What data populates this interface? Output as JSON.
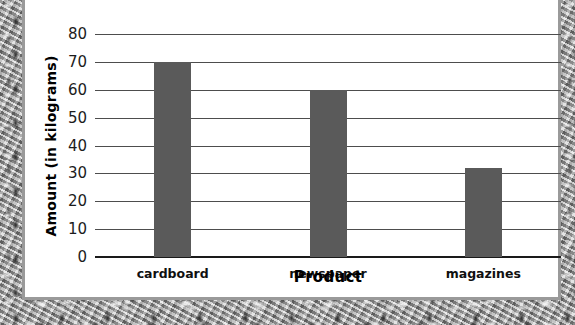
{
  "chart_data": {
    "type": "bar",
    "title": "",
    "subtitle": "",
    "xlabel": "Product",
    "ylabel": "Amount (in kilograms)",
    "categories": [
      "cardboard",
      "newspaper",
      "magazines"
    ],
    "values": [
      70,
      60,
      32
    ],
    "series": [
      {
        "name": "Amount",
        "values": [
          70,
          60,
          32
        ]
      }
    ],
    "ylim": [
      0,
      80
    ],
    "ytick_labels": [
      "80",
      "70",
      "60",
      "50",
      "40",
      "30",
      "20",
      "10",
      "0"
    ],
    "ytick_values": [
      80,
      70,
      60,
      50,
      40,
      30,
      20,
      10,
      0
    ],
    "ytick_step": 10,
    "grid": true,
    "grid_axis": "y",
    "legend": false,
    "legend_position": "none",
    "annotations": [],
    "colors": {
      "bar_fill": "#5a5a5a",
      "gridline": "#4d4d4d",
      "axis_line": "#1a1a1a",
      "text": "#000000",
      "plot_background": "#ffffff",
      "frame_border": "#9a9a9a",
      "page_border_texture": "#b9b9b9"
    }
  }
}
